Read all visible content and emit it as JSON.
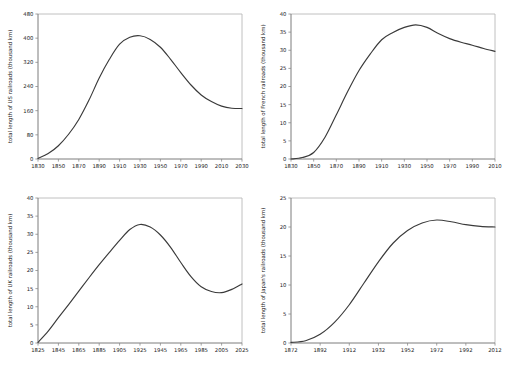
{
  "figure": {
    "background": "#ffffff",
    "curve_color": "#3a3a3a",
    "axis_color": "#6e6e6e",
    "panel_count": 4,
    "layout": "2x2 grid of line charts"
  },
  "chart_data": [
    {
      "id": "us",
      "type": "line",
      "title": "",
      "xlabel": "",
      "ylabel": "total length of US railroads (thousand km)",
      "xlim": [
        1830,
        2030
      ],
      "ylim": [
        0,
        480
      ],
      "xticks": [
        1830,
        1850,
        1870,
        1890,
        1910,
        1930,
        1950,
        1970,
        1990,
        2010,
        2030
      ],
      "yticks": [
        0,
        80,
        160,
        240,
        320,
        400,
        480
      ],
      "grid": false,
      "legend": "none",
      "x": [
        1830,
        1840,
        1850,
        1860,
        1870,
        1880,
        1890,
        1900,
        1910,
        1920,
        1930,
        1940,
        1950,
        1960,
        1970,
        1980,
        1990,
        2000,
        2010,
        2020,
        2030
      ],
      "values": [
        2,
        18,
        44,
        82,
        131,
        195,
        268,
        330,
        380,
        403,
        408,
        396,
        370,
        330,
        286,
        245,
        212,
        190,
        175,
        168,
        167
      ]
    },
    {
      "id": "fr",
      "type": "line",
      "title": "",
      "xlabel": "",
      "ylabel": "total length of French railroads (thousand km)",
      "xlim": [
        1830,
        2010
      ],
      "ylim": [
        0,
        40
      ],
      "xticks": [
        1830,
        1850,
        1870,
        1890,
        1910,
        1930,
        1950,
        1970,
        1990,
        2010
      ],
      "yticks": [
        0,
        5,
        10,
        15,
        20,
        25,
        30,
        35,
        40
      ],
      "grid": false,
      "legend": "none",
      "x": [
        1830,
        1840,
        1850,
        1860,
        1870,
        1880,
        1890,
        1900,
        1910,
        1920,
        1930,
        1940,
        1950,
        1960,
        1970,
        1980,
        1990,
        2000,
        2010
      ],
      "values": [
        0.0,
        0.4,
        1.8,
        6.0,
        12.2,
        18.6,
        24.4,
        29.0,
        32.9,
        34.9,
        36.3,
        37.0,
        36.3,
        34.6,
        33.2,
        32.2,
        31.4,
        30.5,
        29.7
      ]
    },
    {
      "id": "uk",
      "type": "line",
      "title": "",
      "xlabel": "",
      "ylabel": "total length of UK railroads (thousand km)",
      "xlim": [
        1825,
        2025
      ],
      "ylim": [
        0,
        40
      ],
      "xticks": [
        1825,
        1845,
        1865,
        1885,
        1905,
        1925,
        1945,
        1965,
        1985,
        2005,
        2025
      ],
      "yticks": [
        0,
        5,
        10,
        15,
        20,
        25,
        30,
        35,
        40
      ],
      "grid": false,
      "legend": "none",
      "x": [
        1825,
        1835,
        1845,
        1855,
        1865,
        1875,
        1885,
        1895,
        1905,
        1915,
        1925,
        1935,
        1945,
        1955,
        1965,
        1975,
        1985,
        1995,
        2005,
        2015,
        2025
      ],
      "values": [
        0.2,
        3.3,
        7.0,
        10.6,
        14.3,
        18.0,
        21.6,
        25.0,
        28.3,
        31.3,
        32.7,
        32.0,
        29.8,
        26.4,
        22.2,
        18.3,
        15.5,
        14.2,
        13.9,
        14.8,
        16.3
      ]
    },
    {
      "id": "jp",
      "type": "line",
      "title": "",
      "xlabel": "",
      "ylabel": "total length of Japan's railroads (thousand km)",
      "xlim": [
        1872,
        2012
      ],
      "ylim": [
        0,
        25
      ],
      "xticks": [
        1872,
        1892,
        1912,
        1932,
        1952,
        1972,
        1992,
        2012
      ],
      "yticks": [
        0,
        5,
        10,
        15,
        20,
        25
      ],
      "grid": false,
      "legend": "none",
      "x": [
        1872,
        1882,
        1892,
        1902,
        1912,
        1922,
        1932,
        1942,
        1952,
        1962,
        1972,
        1982,
        1992,
        2002,
        2012
      ],
      "values": [
        0.1,
        0.4,
        1.5,
        3.6,
        6.6,
        10.3,
        14.0,
        17.2,
        19.4,
        20.7,
        21.2,
        20.9,
        20.4,
        20.1,
        20.0
      ]
    }
  ]
}
